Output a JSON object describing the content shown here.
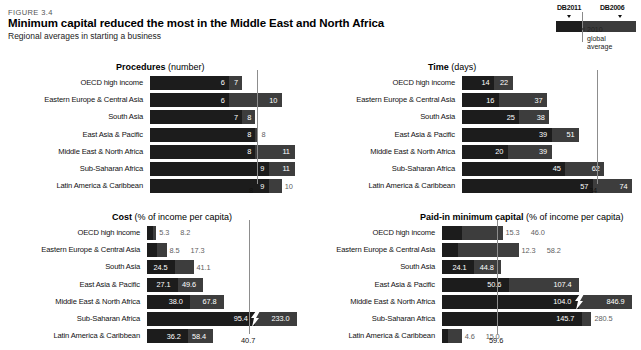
{
  "figure": {
    "number": "FIGURE 3.4",
    "title": "Minimum capital reduced the most in the Middle East and North Africa",
    "subtitle": "Regional averages in starting a business"
  },
  "legend": {
    "series_new_label": "DB2011",
    "series_old_label": "DB2006",
    "note_line1": "2010",
    "note_line2": "global",
    "note_line3": "average",
    "color_new": "#1c1c1c",
    "color_old": "#3d3d3d",
    "color_refline": "#8d8d8d"
  },
  "chart_data": [
    {
      "type": "bar",
      "title": "Procedures",
      "unit": "(number)",
      "orientation": "horizontal",
      "grid": false,
      "legend_position": "top-right",
      "xlabel": "",
      "ylabel": "",
      "xlim": [
        0,
        11
      ],
      "reference_line": {
        "label": "8",
        "value": 8
      },
      "categories": [
        "OECD high income",
        "Eastern Europe & Central Asia",
        "South Asia",
        "East Asia & Pacific",
        "Middle East & North Africa",
        "Sub-Saharan Africa",
        "Latin America & Caribbean"
      ],
      "series": [
        {
          "name": "DB2011",
          "values": [
            6,
            6,
            7,
            8,
            8,
            9,
            9
          ]
        },
        {
          "name": "DB2006",
          "values": [
            7,
            10,
            8,
            8,
            11,
            11,
            10
          ]
        }
      ],
      "labels_new": [
        "6",
        "6",
        "7",
        "8",
        "8",
        "9",
        "9"
      ],
      "labels_old": [
        "7",
        "10",
        "8",
        "8",
        "11",
        "11",
        "10"
      ]
    },
    {
      "type": "bar",
      "title": "Time",
      "unit": "(days)",
      "orientation": "horizontal",
      "grid": false,
      "xlabel": "",
      "ylabel": "",
      "xlim": [
        0,
        74
      ],
      "reference_line": {
        "label": "34",
        "value": 34
      },
      "categories": [
        "OECD high income",
        "Eastern Europe & Central Asia",
        "South Asia",
        "East Asia & Pacific",
        "Middle East & North Africa",
        "Sub-Saharan Africa",
        "Latin America & Caribbean"
      ],
      "series": [
        {
          "name": "DB2011",
          "values": [
            14,
            16,
            25,
            39,
            20,
            45,
            57
          ]
        },
        {
          "name": "DB2006",
          "values": [
            22,
            37,
            38,
            51,
            39,
            62,
            74
          ]
        }
      ],
      "labels_new": [
        "14",
        "16",
        "25",
        "39",
        "20",
        "45",
        "57"
      ],
      "labels_old": [
        "22",
        "37",
        "38",
        "51",
        "39",
        "62",
        "74"
      ]
    },
    {
      "type": "bar",
      "title": "Cost",
      "unit": "(% of income per capita)",
      "orientation": "horizontal",
      "grid": false,
      "xlabel": "",
      "ylabel": "",
      "xlim": [
        0,
        233
      ],
      "axis_break": {
        "category": "Sub-Saharan Africa",
        "after_value": 95.4
      },
      "reference_line": {
        "label": "40.7",
        "value": 40.7
      },
      "categories": [
        "OECD high income",
        "Eastern Europe & Central Asia",
        "South Asia",
        "East Asia & Pacific",
        "Middle East & North Africa",
        "Sub-Saharan Africa",
        "Latin America & Caribbean"
      ],
      "series": [
        {
          "name": "DB2011",
          "values": [
            5.3,
            8.5,
            24.5,
            27.1,
            38.0,
            95.4,
            36.2
          ]
        },
        {
          "name": "DB2006",
          "values": [
            8.2,
            17.3,
            41.1,
            49.6,
            67.8,
            233.0,
            58.4
          ]
        }
      ],
      "labels_new": [
        "5.3",
        "8.5",
        "24.5",
        "27.1",
        "38.0",
        "95.4",
        "36.2"
      ],
      "labels_old": [
        "8.2",
        "17.3",
        "41.1",
        "49.6",
        "67.8",
        "233.0",
        "58.4"
      ]
    },
    {
      "type": "bar",
      "title": "Paid-in minimum capital",
      "unit": "(% of income per capita)",
      "orientation": "horizontal",
      "grid": false,
      "xlabel": "",
      "ylabel": "",
      "xlim": [
        0,
        846.9
      ],
      "axis_break": {
        "category": "Middle East & North Africa",
        "after_value": 104.0
      },
      "reference_line": {
        "label": "59.6",
        "value": 59.6
      },
      "categories": [
        "OECD high income",
        "Eastern Europe & Central Asia",
        "South Asia",
        "East Asia & Pacific",
        "Middle East & North Africa",
        "Sub-Saharan Africa",
        "Latin America & Caribbean"
      ],
      "series": [
        {
          "name": "DB2011",
          "values": [
            15.3,
            12.3,
            24.1,
            50.6,
            104.0,
            145.7,
            4.6
          ]
        },
        {
          "name": "DB2006",
          "values": [
            46.0,
            58.2,
            44.8,
            107.4,
            846.9,
            280.5,
            15.0
          ]
        }
      ],
      "labels_new": [
        "15.3",
        "12.3",
        "24.1",
        "50.6",
        "104.0",
        "145.7",
        "4.6"
      ],
      "labels_old": [
        "46.0",
        "58.2",
        "44.8",
        "107.4",
        "846.9",
        "280.5",
        "15.0"
      ]
    }
  ]
}
